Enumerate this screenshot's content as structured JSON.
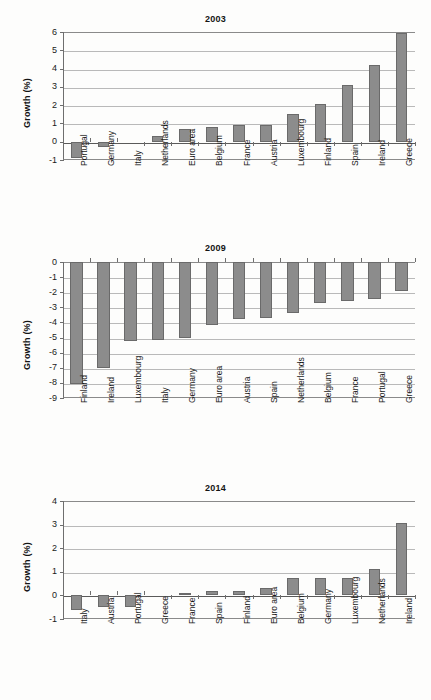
{
  "figure": {
    "ylabel": "Growth (%)",
    "bar_color": "#8c8c8c",
    "bar_edge_color": "#6a6a6a",
    "grid_color": "#b9b9b9",
    "axis_color": "#6e6e6e"
  },
  "chart_data": [
    {
      "type": "bar",
      "title": "2003",
      "xlabel": "",
      "ylabel": "Growth (%)",
      "ylim": [
        -1,
        6
      ],
      "yticks": [
        -1,
        0,
        1,
        2,
        3,
        4,
        5,
        6
      ],
      "ytick_labels": [
        "-1",
        "0",
        "1",
        "2",
        "3",
        "4",
        "5",
        "6"
      ],
      "grid": true,
      "legend": "none",
      "categories": [
        "Portugal",
        "Germany",
        "Italy",
        "Netherlands",
        "Euro area",
        "Belgium",
        "France",
        "Austria",
        "Luxembourg",
        "Finland",
        "Spain",
        "Ireland",
        "Greece"
      ],
      "values": [
        -0.9,
        -0.3,
        0.0,
        0.3,
        0.7,
        0.8,
        0.9,
        0.9,
        1.5,
        2.05,
        3.1,
        4.2,
        5.95
      ]
    },
    {
      "type": "bar",
      "title": "2009",
      "xlabel": "",
      "ylabel": "Growth (%)",
      "ylim": [
        -9,
        0
      ],
      "yticks": [
        -9,
        -8,
        -7,
        -6,
        -5,
        -4,
        -3,
        -2,
        -1,
        0
      ],
      "ytick_labels": [
        "-9",
        "-8",
        "-7",
        "-6",
        "-5",
        "-4",
        "-3",
        "-2",
        "-1",
        "0"
      ],
      "grid": true,
      "legend": "none",
      "categories": [
        "Finland",
        "Ireland",
        "Luxembourg",
        "Italy",
        "Germany",
        "Euro area",
        "Austria",
        "Spain",
        "Netherlands",
        "Belgium",
        "France",
        "Portugal",
        "Greece"
      ],
      "values": [
        -8.1,
        -7.0,
        -5.25,
        -5.15,
        -5.05,
        -4.2,
        -3.75,
        -3.7,
        -3.4,
        -2.7,
        -2.6,
        -2.45,
        -1.95
      ]
    },
    {
      "type": "bar",
      "title": "2014",
      "xlabel": "",
      "ylabel": "Growth (%)",
      "ylim": [
        -1,
        4
      ],
      "yticks": [
        -1,
        0,
        1,
        2,
        3,
        4
      ],
      "ytick_labels": [
        "-1",
        "0",
        "1",
        "2",
        "3",
        "4"
      ],
      "grid": true,
      "legend": "none",
      "categories": [
        "Italy",
        "Austria",
        "Portugal",
        "Greece",
        "France",
        "Spain",
        "Finland",
        "Euro area",
        "Belgium",
        "Germany",
        "Luxembourg",
        "Netherlands",
        "Ireland"
      ],
      "values": [
        -0.6,
        -0.5,
        -0.5,
        0.0,
        0.1,
        0.2,
        0.2,
        0.3,
        0.72,
        0.72,
        0.72,
        1.13,
        3.05
      ]
    }
  ]
}
